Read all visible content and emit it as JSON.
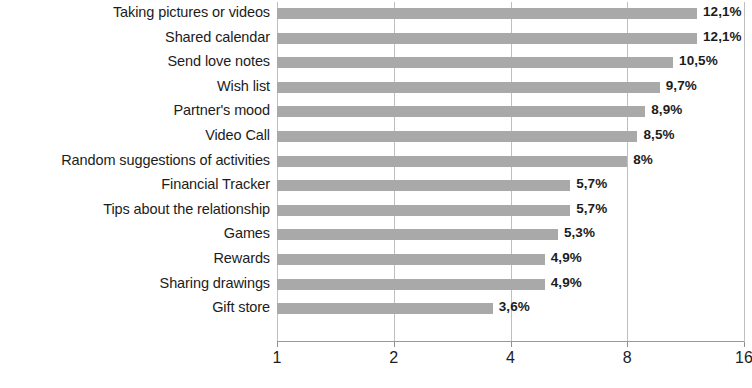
{
  "chart_data": {
    "type": "bar",
    "orientation": "horizontal",
    "title": "",
    "subtitle": "",
    "xlabel": "",
    "ylabel": "",
    "xscale": "log2",
    "xlim": [
      1,
      16
    ],
    "xticks": [
      "1",
      "2",
      "4",
      "8",
      "16"
    ],
    "xtick_values": [
      1,
      2,
      4,
      8,
      16
    ],
    "grid": true,
    "grid_axis": "x",
    "legend": false,
    "bar_color": "#a9a9a9",
    "label_decimal_separator": ",",
    "categories": [
      "Taking pictures or videos",
      "Shared calendar",
      "Send love notes",
      "Wish list",
      "Partner's mood",
      "Video Call",
      "Random suggestions of activities",
      "Financial Tracker",
      "Tips about the relationship",
      "Games",
      "Rewards",
      "Sharing drawings",
      "Gift store"
    ],
    "values": [
      12.1,
      12.1,
      10.5,
      9.7,
      8.9,
      8.5,
      8,
      5.7,
      5.7,
      5.3,
      4.9,
      4.9,
      3.6
    ],
    "value_labels": [
      "12,1%",
      "12,1%",
      "10,5%",
      "9,7%",
      "8,9%",
      "8,5%",
      "8%",
      "5,7%",
      "5,7%",
      "5,3%",
      "4,9%",
      "4,9%",
      "3,6%"
    ]
  }
}
